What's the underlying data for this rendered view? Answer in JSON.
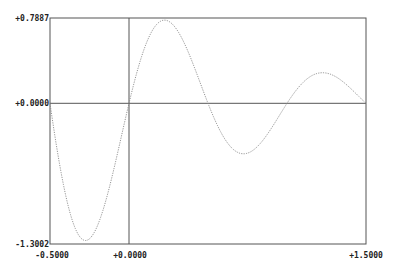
{
  "chart_data": {
    "type": "line",
    "title": "",
    "xlabel": "",
    "ylabel": "",
    "xlim": [
      -0.5,
      1.5
    ],
    "ylim": [
      -1.3002,
      0.7887
    ],
    "grid": false,
    "legend": null,
    "x_tick_labels": [
      "-0.5000",
      "+0.0000",
      "+1.5000"
    ],
    "y_tick_labels": [
      "+0.7887",
      "+0.0000",
      "-1.3002"
    ],
    "series": [
      {
        "name": "curve",
        "style": "dotted",
        "color": "#888888",
        "x": [
          -0.5,
          -0.4,
          -0.3,
          -0.278,
          -0.2,
          -0.1,
          0.0,
          0.1,
          0.2,
          0.22,
          0.3,
          0.4,
          0.5,
          0.6,
          0.7,
          0.715,
          0.8,
          0.9,
          1.0,
          1.1,
          1.2,
          1.22,
          1.3,
          1.4,
          1.5
        ],
        "y": [
          0.0,
          -0.92,
          -1.29,
          -1.3,
          -1.16,
          -0.65,
          0.0,
          0.53,
          0.78,
          0.789,
          0.72,
          0.39,
          0.0,
          -0.52,
          -0.47,
          -0.478,
          -0.43,
          -0.23,
          0.0,
          0.19,
          0.28,
          0.28,
          0.26,
          0.14,
          0.0
        ]
      }
    ]
  },
  "axes": {
    "frame_color": "#555555",
    "zero_line_color": "#555555",
    "y_top_label": "+0.7887",
    "y_zero_label": "+0.0000",
    "y_bottom_label": "-1.3002",
    "x_left_label": "-0.5000",
    "x_zero_label": "+0.0000",
    "x_right_label": "+1.5000"
  }
}
